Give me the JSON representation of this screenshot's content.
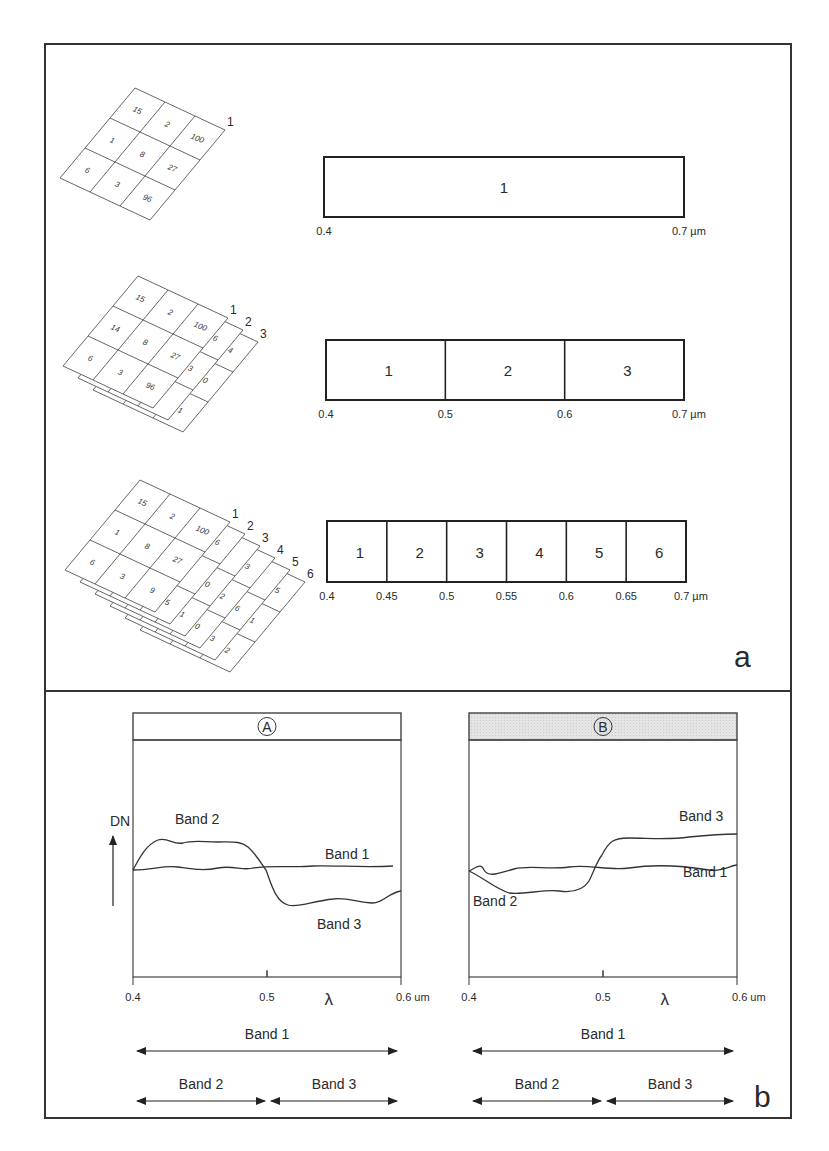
{
  "figure": {
    "panel_a": {
      "label": "a",
      "rows": [
        {
          "name": "single-band",
          "layers": [
            {
              "id": "1",
              "cells": [
                "15",
                "2",
                "100",
                "1",
                "8",
                "27",
                "6",
                "3",
                "96"
              ]
            }
          ],
          "strip": {
            "bands": [
              "1"
            ],
            "ticks": [
              "0.4",
              "0.7 µm"
            ]
          }
        },
        {
          "name": "three-band",
          "layers": [
            {
              "id": "1",
              "cells": [
                "15",
                "2",
                "100",
                "14",
                "8",
                "27",
                "6",
                "3",
                "96"
              ]
            },
            {
              "id": "2",
              "cells": [
                "",
                "",
                "6",
                "",
                "",
                "3",
                "",
                "",
                ""
              ]
            },
            {
              "id": "3",
              "cells": [
                "",
                "",
                "4",
                "",
                "",
                "0",
                "",
                "",
                "1"
              ]
            }
          ],
          "strip": {
            "bands": [
              "1",
              "2",
              "3"
            ],
            "ticks": [
              "0.4",
              "0.5",
              "0.6",
              "0.7 µm"
            ]
          }
        },
        {
          "name": "six-band",
          "layers": [
            {
              "id": "1",
              "cells": [
                "15",
                "2",
                "100",
                "1",
                "8",
                "27",
                "6",
                "3",
                "9"
              ]
            },
            {
              "id": "2",
              "cells": [
                "",
                "",
                "6",
                "",
                "",
                "",
                "",
                "",
                "5"
              ]
            },
            {
              "id": "3",
              "cells": [
                "",
                "",
                "",
                "",
                "",
                "0",
                "",
                "",
                "1"
              ]
            },
            {
              "id": "4",
              "cells": [
                "",
                "",
                "3",
                "",
                "",
                "2",
                "",
                "",
                "0"
              ]
            },
            {
              "id": "5",
              "cells": [
                "",
                "",
                "",
                "",
                "",
                "6",
                "",
                "",
                "3"
              ]
            },
            {
              "id": "6",
              "cells": [
                "",
                "",
                "5",
                "",
                "",
                "1",
                "",
                "",
                "2"
              ]
            }
          ],
          "strip": {
            "bands": [
              "1",
              "2",
              "3",
              "4",
              "5",
              "6"
            ],
            "ticks": [
              "0.4",
              "0.45",
              "0.5",
              "0.55",
              "0.6",
              "0.65",
              "0.7 µm"
            ]
          }
        }
      ]
    },
    "panel_b": {
      "label": "b",
      "y_axis_label": "DN",
      "x_symbol": "λ",
      "charts": [
        {
          "id": "A",
          "header_shaded": false,
          "x_ticks": [
            "0.4",
            "0.5",
            "0.6 um"
          ],
          "curve_labels": [
            {
              "text": "Band 2",
              "curve": "band2"
            },
            {
              "text": "Band 1",
              "curve": "band1"
            },
            {
              "text": "Band 3",
              "curve": "band3"
            }
          ],
          "ranges": [
            {
              "label": "Band 1",
              "from": "0.4",
              "to": "0.6"
            },
            {
              "label": "Band 2",
              "from": "0.4",
              "to": "0.5"
            },
            {
              "label": "Band 3",
              "from": "0.5",
              "to": "0.6"
            }
          ]
        },
        {
          "id": "B",
          "header_shaded": true,
          "x_ticks": [
            "0.4",
            "0.5",
            "0.6 um"
          ],
          "curve_labels": [
            {
              "text": "Band 3",
              "curve": "band3"
            },
            {
              "text": "Band 1",
              "curve": "band1"
            },
            {
              "text": "Band 2",
              "curve": "band2"
            }
          ],
          "ranges": [
            {
              "label": "Band 1",
              "from": "0.4",
              "to": "0.6"
            },
            {
              "label": "Band 2",
              "from": "0.4",
              "to": "0.5"
            },
            {
              "label": "Band 3",
              "from": "0.5",
              "to": "0.6"
            }
          ]
        }
      ]
    }
  },
  "chart_data": [
    {
      "type": "line",
      "title": "A",
      "xlabel": "λ (um)",
      "ylabel": "DN",
      "xlim": [
        0.4,
        0.6
      ],
      "grid": false,
      "x": [
        0.4,
        0.42,
        0.44,
        0.46,
        0.48,
        0.5,
        0.52,
        0.54,
        0.56,
        0.58,
        0.6
      ],
      "series": [
        {
          "name": "Band 1",
          "values": [
            50,
            51,
            50,
            51,
            50,
            50,
            51,
            50,
            51,
            51,
            51
          ]
        },
        {
          "name": "Band 2 (0.4–0.5)",
          "values": [
            50,
            72,
            71,
            71,
            70,
            50
          ]
        },
        {
          "name": "Band 3 (0.5–0.6)",
          "values": [
            50,
            38,
            40,
            41,
            39,
            44
          ]
        }
      ],
      "note": "relative DN, y axis unscaled"
    },
    {
      "type": "line",
      "title": "B",
      "xlabel": "λ (um)",
      "ylabel": "DN",
      "xlim": [
        0.4,
        0.6
      ],
      "grid": false,
      "x": [
        0.4,
        0.42,
        0.44,
        0.46,
        0.48,
        0.5,
        0.52,
        0.54,
        0.56,
        0.58,
        0.6
      ],
      "series": [
        {
          "name": "Band 1",
          "values": [
            50,
            51,
            52,
            51,
            51,
            52,
            51,
            52,
            53,
            51,
            53
          ]
        },
        {
          "name": "Band 2 (0.4–0.5)",
          "values": [
            50,
            42,
            40,
            40,
            41,
            50
          ]
        },
        {
          "name": "Band 3 (0.5–0.6)",
          "values": [
            50,
            62,
            62,
            62,
            63,
            63
          ]
        }
      ],
      "note": "relative DN, y axis unscaled"
    }
  ]
}
